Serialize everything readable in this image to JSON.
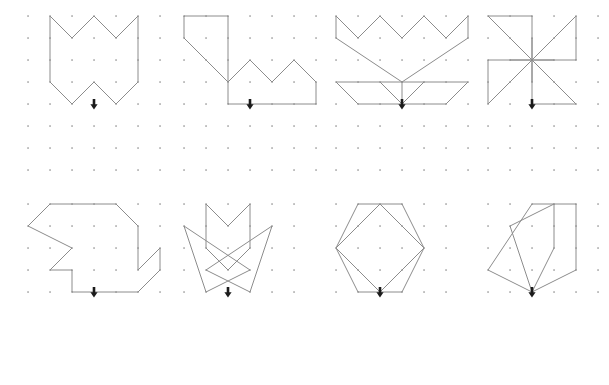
{
  "figure": {
    "title": "",
    "background_color": "#ffffff",
    "stroke_color": "#8c8c8c",
    "dot_color": "#9a9a9a",
    "arrow_color": "#1b1b1b",
    "grid_spacing": 22,
    "rows": 2,
    "columns": 4,
    "panel_count": 8
  },
  "panels": [
    {
      "id": "panel-1",
      "name": "zigzag-crown",
      "origin": {
        "x": 24,
        "y": 12
      },
      "grid": {
        "cols": 7,
        "rows": 8,
        "spacing": 22
      },
      "arrow": {
        "col": 3,
        "row": 4
      },
      "paths": [
        {
          "name": "zigzag-crown-outline",
          "closed": true,
          "points": [
            [
              1,
              0
            ],
            [
              2,
              1
            ],
            [
              3,
              0
            ],
            [
              4,
              1
            ],
            [
              5,
              0
            ],
            [
              5,
              3
            ],
            [
              4,
              4
            ],
            [
              3,
              3
            ],
            [
              2,
              4
            ],
            [
              1,
              3
            ]
          ]
        }
      ]
    },
    {
      "id": "panel-2",
      "name": "stepped-zigzag-bird",
      "origin": {
        "x": 180,
        "y": 12
      },
      "grid": {
        "cols": 7,
        "rows": 8,
        "spacing": 22
      },
      "arrow": {
        "col": 3,
        "row": 4
      },
      "paths": [
        {
          "name": "stepped-zigzag-bird-outline",
          "closed": true,
          "points": [
            [
              0,
              0
            ],
            [
              2,
              0
            ],
            [
              2,
              3
            ],
            [
              3,
              2
            ],
            [
              4,
              3
            ],
            [
              5,
              2
            ],
            [
              6,
              3
            ],
            [
              6,
              4
            ],
            [
              5,
              4
            ],
            [
              2,
              4
            ],
            [
              2,
              3
            ],
            [
              1,
              2
            ],
            [
              0,
              1
            ]
          ]
        }
      ]
    },
    {
      "id": "panel-3",
      "name": "crown-and-wings",
      "origin": {
        "x": 332,
        "y": 12
      },
      "grid": {
        "cols": 7,
        "rows": 8,
        "spacing": 22
      },
      "arrow": {
        "col": 3,
        "row": 4
      },
      "paths": [
        {
          "name": "crown-upper-outline",
          "closed": true,
          "points": [
            [
              0,
              0
            ],
            [
              1,
              1
            ],
            [
              2,
              0
            ],
            [
              3,
              1
            ],
            [
              4,
              0
            ],
            [
              5,
              1
            ],
            [
              6,
              0
            ],
            [
              6,
              1
            ],
            [
              3,
              3
            ],
            [
              0,
              1
            ]
          ]
        },
        {
          "name": "wings-lower-outline",
          "closed": true,
          "points": [
            [
              0,
              3
            ],
            [
              6,
              3
            ],
            [
              5,
              4
            ],
            [
              1,
              4
            ]
          ]
        },
        {
          "name": "wing-fold-left",
          "closed": false,
          "points": [
            [
              2,
              3
            ],
            [
              3,
              4
            ]
          ]
        },
        {
          "name": "wing-fold-right",
          "closed": false,
          "points": [
            [
              4,
              3
            ],
            [
              3,
              4
            ]
          ]
        },
        {
          "name": "wing-center-stem",
          "closed": false,
          "points": [
            [
              3,
              3
            ],
            [
              3,
              4
            ]
          ]
        }
      ]
    },
    {
      "id": "panel-4",
      "name": "pinwheel",
      "origin": {
        "x": 484,
        "y": 12
      },
      "grid": {
        "cols": 6,
        "rows": 8,
        "spacing": 22
      },
      "arrow": {
        "col": 2,
        "row": 4
      },
      "paths": [
        {
          "name": "pinwheel-blade-upper-left",
          "closed": true,
          "points": [
            [
              0,
              0
            ],
            [
              2,
              0
            ],
            [
              2,
              2
            ]
          ]
        },
        {
          "name": "pinwheel-blade-upper-right",
          "closed": true,
          "points": [
            [
              4,
              0
            ],
            [
              4,
              2
            ],
            [
              2,
              2
            ]
          ]
        },
        {
          "name": "pinwheel-blade-lower-right",
          "closed": true,
          "points": [
            [
              4,
              4
            ],
            [
              2,
              4
            ],
            [
              2,
              2
            ]
          ]
        },
        {
          "name": "pinwheel-blade-lower-left",
          "closed": true,
          "points": [
            [
              0,
              4
            ],
            [
              0,
              2
            ],
            [
              2,
              2
            ]
          ]
        },
        {
          "name": "pinwheel-spoke-vertical",
          "closed": false,
          "points": [
            [
              2,
              1
            ],
            [
              2,
              3
            ]
          ]
        },
        {
          "name": "pinwheel-spoke-horizontal",
          "closed": false,
          "points": [
            [
              1,
              2
            ],
            [
              3,
              2
            ]
          ]
        }
      ]
    },
    {
      "id": "panel-5",
      "name": "angular-bird",
      "origin": {
        "x": 24,
        "y": 200
      },
      "grid": {
        "cols": 7,
        "rows": 5,
        "spacing": 22
      },
      "arrow": {
        "col": 3,
        "row": 4
      },
      "paths": [
        {
          "name": "angular-bird-outline",
          "closed": true,
          "points": [
            [
              1,
              0
            ],
            [
              4,
              0
            ],
            [
              5,
              1
            ],
            [
              5,
              3
            ],
            [
              6,
              2
            ],
            [
              6,
              3
            ],
            [
              5,
              4
            ],
            [
              2,
              4
            ],
            [
              2,
              3
            ],
            [
              1,
              3
            ],
            [
              2,
              2
            ],
            [
              0,
              1
            ]
          ]
        }
      ]
    },
    {
      "id": "panel-6",
      "name": "chevron-with-crossed-wings",
      "origin": {
        "x": 180,
        "y": 200
      },
      "grid": {
        "cols": 6,
        "rows": 5,
        "spacing": 22
      },
      "arrow": {
        "col": 2,
        "row": 4
      },
      "paths": [
        {
          "name": "chevron-outline",
          "closed": true,
          "points": [
            [
              1,
              0
            ],
            [
              2,
              1
            ],
            [
              3,
              0
            ],
            [
              3,
              2
            ],
            [
              2,
              3
            ],
            [
              1,
              2
            ]
          ]
        },
        {
          "name": "left-wing-triangle",
          "closed": true,
          "points": [
            [
              0,
              1
            ],
            [
              3,
              3
            ],
            [
              1,
              4
            ]
          ]
        },
        {
          "name": "right-wing-triangle",
          "closed": true,
          "points": [
            [
              4,
              1
            ],
            [
              1,
              3
            ],
            [
              3,
              4
            ]
          ]
        }
      ]
    },
    {
      "id": "panel-7",
      "name": "hexagon-with-diamond",
      "origin": {
        "x": 332,
        "y": 200
      },
      "grid": {
        "cols": 6,
        "rows": 5,
        "spacing": 22
      },
      "arrow": {
        "col": 2,
        "row": 4
      },
      "paths": [
        {
          "name": "hexagon-outline",
          "closed": true,
          "points": [
            [
              1,
              0
            ],
            [
              3,
              0
            ],
            [
              4,
              2
            ],
            [
              3,
              4
            ],
            [
              1,
              4
            ],
            [
              0,
              2
            ]
          ]
        },
        {
          "name": "diamond-outline",
          "closed": true,
          "points": [
            [
              2,
              0
            ],
            [
              4,
              2
            ],
            [
              2,
              4
            ],
            [
              0,
              2
            ]
          ]
        }
      ]
    },
    {
      "id": "panel-8",
      "name": "overlapping-pentagons",
      "origin": {
        "x": 484,
        "y": 200
      },
      "grid": {
        "cols": 6,
        "rows": 5,
        "spacing": 22
      },
      "arrow": {
        "col": 2,
        "row": 4
      },
      "paths": [
        {
          "name": "pentagon-large-outline",
          "closed": true,
          "points": [
            [
              2,
              0
            ],
            [
              4,
              0
            ],
            [
              4,
              3
            ],
            [
              2,
              4
            ],
            [
              0,
              3
            ]
          ]
        },
        {
          "name": "pentagon-small-outline",
          "closed": true,
          "points": [
            [
              1,
              1
            ],
            [
              3,
              0
            ],
            [
              3,
              2
            ],
            [
              2,
              4
            ]
          ]
        }
      ]
    }
  ]
}
